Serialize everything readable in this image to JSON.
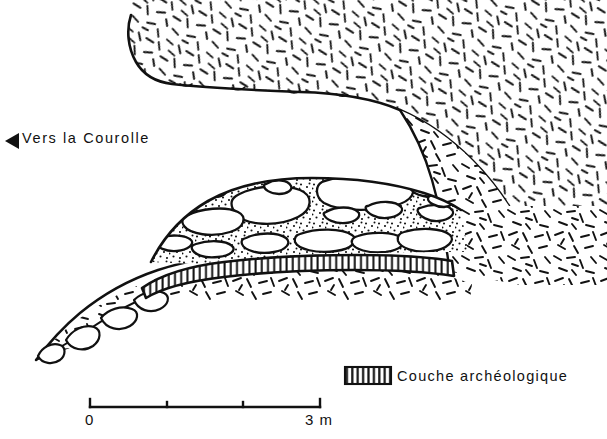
{
  "figure": {
    "kind": "archaeological-cross-section",
    "width": 607,
    "height": 439,
    "background_color": "#ffffff",
    "ink_color": "#000000"
  },
  "annotations": {
    "direction": {
      "marker_icon": "left-triangle-icon",
      "text": "Vers la Courolle"
    }
  },
  "legend": {
    "items": [
      {
        "swatch_pattern": "vertical-hatch",
        "label": "Couche archéologique"
      }
    ]
  },
  "scale_bar": {
    "start_label": "0",
    "end_label": "3 m",
    "unit": "m",
    "total_meters": 3,
    "ticks": [
      0,
      1,
      2,
      3
    ],
    "pixel_start": 90,
    "pixel_end": 320
  },
  "units": {
    "ceiling": {
      "name": "roof-rock-mass",
      "pattern": "dash-hatch"
    },
    "scree": {
      "name": "wall-scree-blocks",
      "pattern": "dash-hatch-with-blocks"
    },
    "sediment": {
      "name": "sediment-fill",
      "pattern": "stipple-with-blocks"
    },
    "archaeological_layer": {
      "name": "couche-archeologique",
      "pattern": "vertical-hatch"
    },
    "substrate": {
      "name": "basal-substrate",
      "pattern": "dash-hatch"
    }
  }
}
